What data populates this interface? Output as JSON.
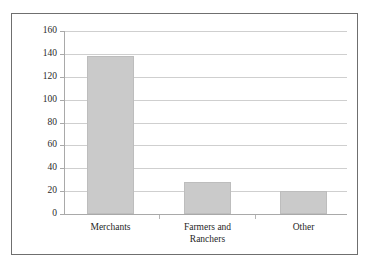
{
  "chart_data": {
    "type": "bar",
    "title": "",
    "subtitle": "",
    "xlabel": "",
    "ylabel": "",
    "categories": [
      "Merchants",
      "Farmers and\nRanchers",
      "Other"
    ],
    "values": [
      138,
      28,
      20
    ],
    "ylim": [
      0,
      160
    ],
    "yticks": [
      0,
      20,
      40,
      60,
      80,
      100,
      120,
      140,
      160
    ],
    "ytick_labels": [
      "0",
      "20",
      "40",
      "60",
      "80",
      "100",
      "120",
      "140",
      "160"
    ],
    "grid": true,
    "legend": false,
    "legend_position": "none",
    "bar_color": "#cacaca",
    "bar_edge_color": "#bdbdbd",
    "grid_color": "#cfcfcf",
    "axis_color": "#a9a9a9",
    "frame_color": "#6f6f6f",
    "background": "#ffffff"
  }
}
